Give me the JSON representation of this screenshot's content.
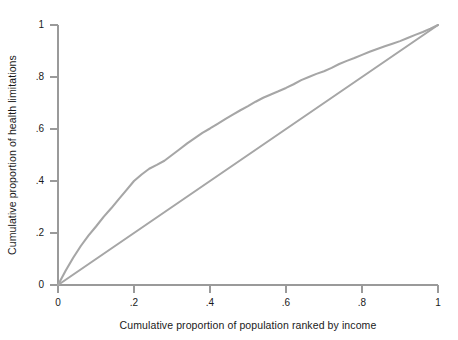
{
  "chart_data": {
    "type": "line",
    "title": "",
    "subtitle": "",
    "xlabel": "Cumulative proportion of population ranked by income",
    "ylabel": "Cumulative proportion of health limitations",
    "xlim": [
      0,
      1
    ],
    "ylim": [
      0,
      1
    ],
    "grid": false,
    "legend": "none",
    "xticks": [
      0,
      0.2,
      0.4,
      0.6,
      0.8,
      1
    ],
    "xticklabels": [
      "0",
      ".2",
      ".4",
      ".6",
      ".8",
      "1"
    ],
    "yticks": [
      0,
      0.2,
      0.4,
      0.6,
      0.8,
      1
    ],
    "yticklabels": [
      "0",
      ".2",
      ".4",
      ".6",
      ".8",
      "1"
    ],
    "line_color": "#a6a6a6",
    "axis_color": "#9a9a9a",
    "text_color": "#1a1a1a",
    "series": [
      {
        "name": "concentration-curve",
        "type": "line",
        "x": [
          0,
          0.02,
          0.04,
          0.06,
          0.08,
          0.1,
          0.12,
          0.14,
          0.16,
          0.18,
          0.2,
          0.22,
          0.24,
          0.26,
          0.28,
          0.3,
          0.32,
          0.34,
          0.36,
          0.38,
          0.4,
          0.42,
          0.44,
          0.46,
          0.48,
          0.5,
          0.52,
          0.54,
          0.56,
          0.58,
          0.6,
          0.62,
          0.64,
          0.66,
          0.68,
          0.7,
          0.72,
          0.74,
          0.76,
          0.78,
          0.8,
          0.82,
          0.84,
          0.86,
          0.88,
          0.9,
          0.92,
          0.94,
          0.96,
          0.98,
          1.0
        ],
        "y": [
          0,
          0.055,
          0.105,
          0.15,
          0.19,
          0.225,
          0.262,
          0.295,
          0.33,
          0.365,
          0.4,
          0.425,
          0.447,
          0.462,
          0.478,
          0.5,
          0.522,
          0.545,
          0.565,
          0.585,
          0.602,
          0.62,
          0.638,
          0.655,
          0.672,
          0.688,
          0.705,
          0.72,
          0.733,
          0.745,
          0.758,
          0.772,
          0.788,
          0.8,
          0.812,
          0.822,
          0.835,
          0.85,
          0.862,
          0.873,
          0.885,
          0.897,
          0.908,
          0.918,
          0.928,
          0.938,
          0.95,
          0.962,
          0.973,
          0.986,
          1.0
        ]
      },
      {
        "name": "line-of-equality",
        "type": "line",
        "x": [
          0,
          1
        ],
        "y": [
          0,
          1
        ]
      }
    ]
  }
}
